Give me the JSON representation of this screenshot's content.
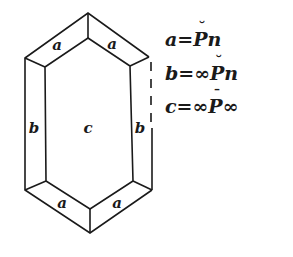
{
  "diagram": {
    "type": "crystal-form",
    "stroke_color": "#1a1a1a",
    "background": "#ffffff",
    "faces": {
      "a_top_left": "a",
      "a_top_right": "a",
      "b_left": "b",
      "c_center": "c",
      "b_right": "b",
      "a_bottom_left": "a",
      "a_bottom_right": "a"
    }
  },
  "legend": {
    "formulas": [
      {
        "face": "a",
        "equals": "=",
        "prefix": "",
        "symbol": "P",
        "accent": "˘",
        "suffix": "n"
      },
      {
        "face": "b",
        "equals": "=",
        "prefix": "∞",
        "symbol": "P",
        "accent": "˘",
        "suffix": "n"
      },
      {
        "face": "c",
        "equals": "=",
        "prefix": "∞",
        "symbol": "P",
        "accent": "¯",
        "suffix": "∞"
      }
    ]
  }
}
